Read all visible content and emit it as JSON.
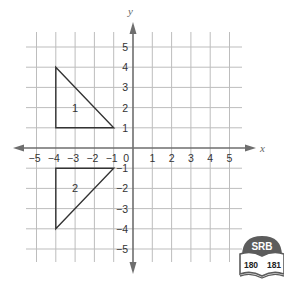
{
  "diagram": {
    "type": "coordinate-plane",
    "axes": {
      "x_label": "x",
      "y_label": "y",
      "x_range": [
        -5,
        5
      ],
      "y_range": [
        -5,
        5
      ],
      "origin_label": "0",
      "x_ticks": [
        "−5",
        "−4",
        "−3",
        "−2",
        "−1",
        "1",
        "2",
        "3",
        "4",
        "5"
      ],
      "y_ticks": [
        "5",
        "4",
        "3",
        "2",
        "1",
        "−1",
        "−2",
        "−3",
        "−4",
        "−5"
      ]
    },
    "shapes": [
      {
        "label": "1",
        "vertices": [
          [
            -4,
            4
          ],
          [
            -4,
            1
          ],
          [
            -1,
            1
          ]
        ]
      },
      {
        "label": "2",
        "vertices": [
          [
            -4,
            -4
          ],
          [
            -4,
            -1
          ],
          [
            -1,
            -1
          ]
        ]
      }
    ],
    "colors": {
      "grid": "#bdbdbd",
      "axis": "#6e6e6e",
      "shape": "#333333",
      "badge": "#5c5c5c"
    }
  },
  "badge": {
    "title": "SRB",
    "pages": [
      "180",
      "181"
    ]
  }
}
